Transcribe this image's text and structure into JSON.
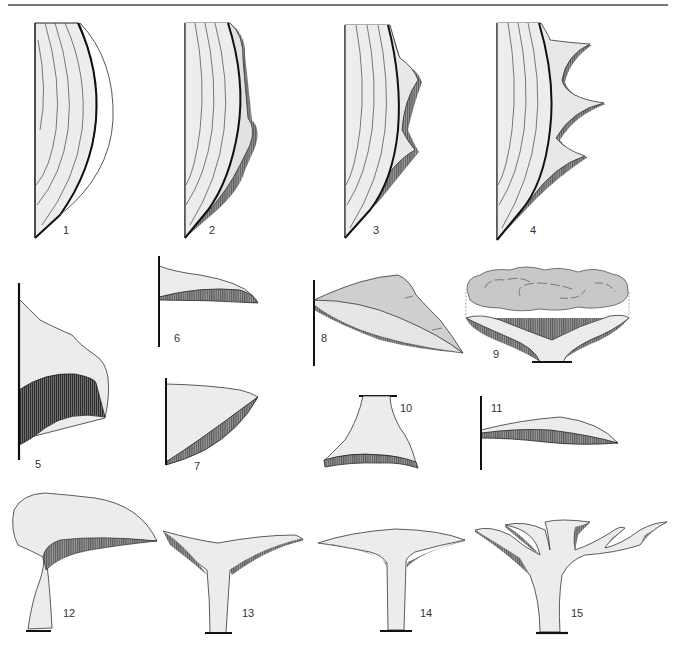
{
  "plate": {
    "top_rule_color": "#777777",
    "fill_light": "#ededed",
    "fill_mid": "#d6d6d6",
    "fill_dark": "#b9b9b9",
    "hatch_color": "#555555",
    "outline_color": "#222222",
    "figures": [
      {
        "id": 1,
        "label": "1"
      },
      {
        "id": 2,
        "label": "2"
      },
      {
        "id": 3,
        "label": "3"
      },
      {
        "id": 4,
        "label": "4"
      },
      {
        "id": 5,
        "label": "5"
      },
      {
        "id": 6,
        "label": "6"
      },
      {
        "id": 7,
        "label": "7"
      },
      {
        "id": 8,
        "label": "8"
      },
      {
        "id": 9,
        "label": "9"
      },
      {
        "id": 10,
        "label": "10"
      },
      {
        "id": 11,
        "label": "11"
      },
      {
        "id": 12,
        "label": "12"
      },
      {
        "id": 13,
        "label": "13"
      },
      {
        "id": 14,
        "label": "14"
      },
      {
        "id": 15,
        "label": "15"
      }
    ]
  }
}
